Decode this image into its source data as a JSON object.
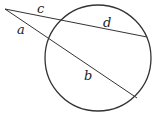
{
  "diagram": {
    "type": "two-secants-from-external-point",
    "labels": {
      "a": "a",
      "b": "b",
      "c": "c",
      "d": "d"
    },
    "colors": {
      "stroke": "#333333",
      "background": "#ffffff"
    }
  }
}
